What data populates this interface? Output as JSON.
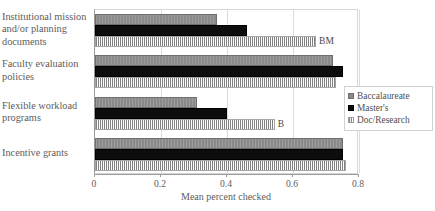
{
  "chart_data": {
    "type": "bar",
    "orientation": "horizontal",
    "title": "",
    "xlabel": "Mean percent checked",
    "ylabel": "",
    "xlim": [
      0,
      0.8
    ],
    "xticks": [
      "0",
      "0.2",
      "0.4",
      "0.6",
      "0.8"
    ],
    "xtick_values": [
      0,
      0.2,
      0.4,
      0.6,
      0.8
    ],
    "grid": "vertical",
    "legend_position": "right",
    "categories": [
      "Institutional mission and/or planning documents",
      "Faculty evaluation policies",
      "Flexible workload programs",
      "Incentive grants"
    ],
    "series": [
      {
        "name": "Baccalaureate",
        "color": "#8a8a8a",
        "pattern": "solid-gray",
        "values": [
          0.37,
          0.72,
          0.31,
          0.75
        ]
      },
      {
        "name": "Master's",
        "color": "#0d0d0d",
        "pattern": "solid-black",
        "values": [
          0.46,
          0.75,
          0.4,
          0.75
        ]
      },
      {
        "name": "Doc/Research",
        "color": "#808080",
        "pattern": "vertical-stripes",
        "values": [
          0.67,
          0.73,
          0.545,
          0.76
        ]
      }
    ],
    "annotations": [
      {
        "text": "BM",
        "category": "Institutional mission and/or planning documents",
        "series": "Doc/Research"
      },
      {
        "text": "B",
        "category": "Flexible workload programs",
        "series": "Doc/Research"
      }
    ]
  },
  "categories_display": [
    [
      "Institutional mission",
      "and/or planning",
      "documents"
    ],
    [
      "Faculty evaluation",
      "policies"
    ],
    [
      "Flexible workload",
      "programs"
    ],
    [
      "Incentive grants"
    ]
  ],
  "legend": {
    "items": [
      {
        "label": "Baccalaureate",
        "swatch": "bacc"
      },
      {
        "label": "Master's",
        "swatch": "mast"
      },
      {
        "label": "Doc/Research",
        "swatch": "doc"
      }
    ]
  },
  "axis": {
    "x_label": "Mean percent checked",
    "x_ticks": [
      "0",
      "0.2",
      "0.4",
      "0.6",
      "0.8"
    ]
  }
}
